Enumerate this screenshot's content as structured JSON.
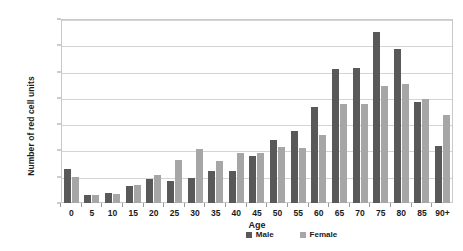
{
  "chart_data": {
    "type": "bar",
    "title": "",
    "xlabel": "Age",
    "ylabel": "Number of red cell units",
    "ylim": [
      0,
      3500
    ],
    "ytick_step": 500,
    "grid": true,
    "legend_position": "bottom-right",
    "categories": [
      "0",
      "5",
      "10",
      "15",
      "20",
      "25",
      "30",
      "35",
      "40",
      "45",
      "50",
      "55",
      "60",
      "65",
      "70",
      "75",
      "80",
      "85",
      "90+"
    ],
    "series": [
      {
        "name": "Male",
        "color": "#595959",
        "values": [
          650,
          160,
          195,
          325,
          460,
          410,
          485,
          615,
          600,
          890,
          1205,
          1370,
          1825,
          2550,
          2570,
          3250,
          2930,
          1925,
          1080
        ]
      },
      {
        "name": "Female",
        "color": "#a6a6a6",
        "values": [
          500,
          145,
          165,
          345,
          535,
          815,
          1025,
          800,
          945,
          960,
          1065,
          1040,
          1300,
          1885,
          1885,
          2225,
          2265,
          1975,
          1665
        ]
      }
    ],
    "ytick_labels": [
      "0",
      "500",
      "1000",
      "1500",
      "2000",
      "2500",
      "3000",
      "3500"
    ]
  }
}
